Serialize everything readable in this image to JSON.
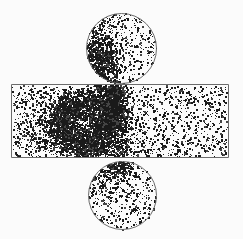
{
  "figure": {
    "title": "Particle distribution scatter diagram",
    "description": "Monte-Carlo style point scatter plot: a horizontal rectangular chamber with a circular region attached above and below, a dense hook-shaped particle cluster on the left-centre of the chamber and a narrow dense jet connecting the chamber to the upper circle.",
    "width": 243,
    "height": 239,
    "background_color": "#fbfbfb",
    "point_color": "#1a1a1a",
    "outline_color": "#6b6b6b"
  },
  "chart_data": {
    "type": "scatter",
    "title": "Particle distribution scatter diagram",
    "xlabel": "",
    "ylabel": "",
    "grid": false,
    "legend": "none",
    "xlim": [
      0,
      243
    ],
    "ylim": [
      0,
      239
    ],
    "random_seed": 20240517,
    "regions": [
      {
        "name": "upper-circle",
        "shape": "circle",
        "cx": 121,
        "cy": 48,
        "r": 35,
        "outline": true,
        "base_point_count": 430,
        "base_density": "sparse-uniform",
        "point_size_px": 1.4
      },
      {
        "name": "chamber-rectangle",
        "shape": "rect",
        "x": 11,
        "y": 84,
        "width": 217,
        "height": 73,
        "outline": true,
        "base_point_count": 1750,
        "base_density": "sparse-uniform",
        "point_size_px": 1.4
      },
      {
        "name": "lower-circle",
        "shape": "circle",
        "cx": 122,
        "cy": 195,
        "r": 34,
        "outline": true,
        "base_point_count": 400,
        "base_density": "sparse-uniform",
        "point_size_px": 1.4
      }
    ],
    "clusters": [
      {
        "name": "hook-cluster-core",
        "shape": "annulus-arc",
        "cx": 83,
        "cy": 124,
        "r_inner": 13,
        "r_outer": 32,
        "angle_start_deg": -40,
        "angle_end_deg": 300,
        "point_count": 1500,
        "spread_px": 5.0,
        "point_size_px": 1.5,
        "clip_region": "chamber-rectangle"
      },
      {
        "name": "hook-cluster-halo",
        "shape": "gaussian-blob",
        "cx": 86,
        "cy": 124,
        "sigma_x": 26,
        "sigma_y": 21,
        "point_count": 900,
        "point_size_px": 1.4,
        "clip_region": "chamber-rectangle"
      },
      {
        "name": "upper-jet-column",
        "shape": "vertical-band",
        "cx": 112,
        "cy": 105,
        "sigma_x": 7,
        "half_height": 24,
        "point_count": 760,
        "point_size_px": 1.5,
        "clip_region": "chamber-rectangle"
      },
      {
        "name": "jet-tail-in-upper-circle",
        "shape": "gaussian-blob",
        "cx": 102,
        "cy": 61,
        "sigma_x": 9,
        "sigma_y": 13,
        "point_count": 320,
        "point_size_px": 1.5,
        "clip_region": "upper-circle"
      },
      {
        "name": "upper-circle-left-arc",
        "shape": "gaussian-blob",
        "cx": 96,
        "cy": 44,
        "sigma_x": 11,
        "sigma_y": 16,
        "point_count": 260,
        "point_size_px": 1.4,
        "clip_region": "upper-circle"
      },
      {
        "name": "lower-neck-spot",
        "shape": "gaussian-blob",
        "cx": 118,
        "cy": 163,
        "sigma_x": 8,
        "sigma_y": 6,
        "point_count": 170,
        "point_size_px": 1.4,
        "clip_region": "lower-circle"
      },
      {
        "name": "chamber-bottom-jet",
        "shape": "gaussian-blob",
        "cx": 117,
        "cy": 150,
        "sigma_x": 9,
        "sigma_y": 8,
        "point_count": 200,
        "point_size_px": 1.4,
        "clip_region": "chamber-rectangle"
      },
      {
        "name": "left-mid-diffuse",
        "shape": "gaussian-blob",
        "cx": 55,
        "cy": 128,
        "sigma_x": 22,
        "sigma_y": 17,
        "point_count": 420,
        "point_size_px": 1.3,
        "clip_region": "chamber-rectangle"
      },
      {
        "name": "lower-circle-upper-left-patch",
        "shape": "gaussian-blob",
        "cx": 105,
        "cy": 178,
        "sigma_x": 14,
        "sigma_y": 12,
        "point_count": 150,
        "point_size_px": 1.3,
        "clip_region": "lower-circle"
      }
    ]
  }
}
